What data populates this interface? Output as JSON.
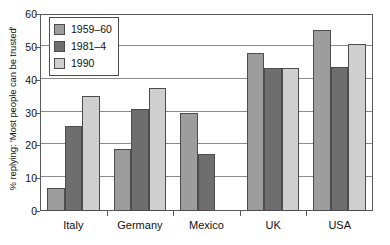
{
  "chart_data": {
    "type": "bar",
    "title": "",
    "subtitle": "",
    "xlabel": "",
    "ylabel": "% replying: 'Most people can be trusted'",
    "categories": [
      "Italy",
      "Germany",
      "Mexico",
      "UK",
      "USA"
    ],
    "series": [
      {
        "name": "1959–60",
        "color": "#9d9d9d",
        "values": [
          7,
          19,
          30,
          48,
          55
        ]
      },
      {
        "name": "1981–4",
        "color": "#6e6e6e",
        "values": [
          26,
          31,
          17.5,
          43.5,
          44
        ]
      },
      {
        "name": "1990",
        "color": "#cfcfcf",
        "values": [
          35,
          37.5,
          null,
          43.5,
          51
        ]
      }
    ],
    "ylim": [
      0,
      60
    ],
    "yticks": [
      0,
      10,
      20,
      30,
      40,
      50,
      60
    ],
    "ytick_labels": [
      "0",
      "10",
      "20",
      "30",
      "40",
      "50",
      "60"
    ],
    "grid": true,
    "grid_axis": "y",
    "legend_position": "top-left"
  },
  "colors": {
    "axis": "#5a5a5a",
    "grid": "#8a8a8a",
    "bar_edge": "#4d4d4d",
    "background": "#ffffff",
    "text": "#111111"
  }
}
